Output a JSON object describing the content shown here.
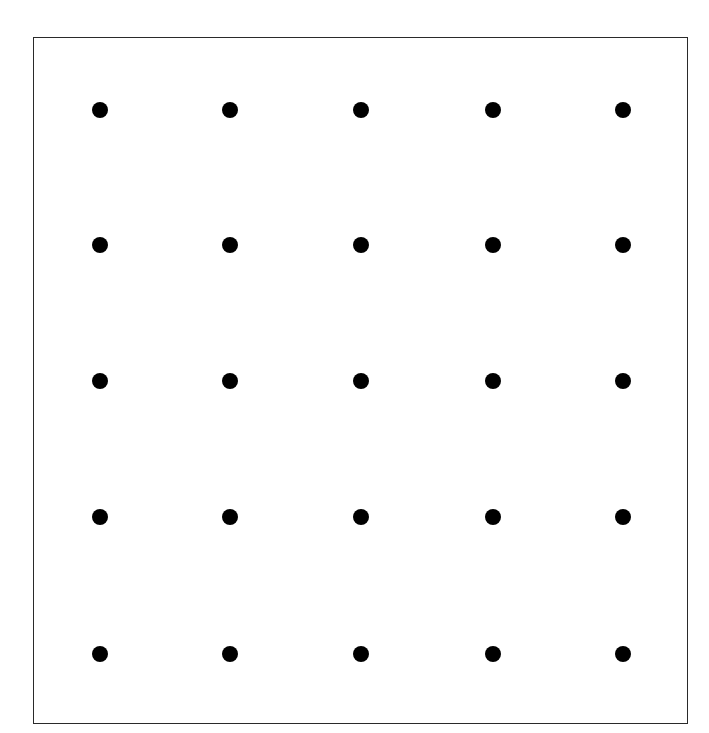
{
  "diagram": {
    "type": "dot-grid",
    "rows": 5,
    "columns": 5,
    "dot_color": "#000000",
    "border_color": "#2a2a2a",
    "background_color": "#ffffff",
    "column_x": [
      100,
      230,
      361,
      493,
      623
    ],
    "row_y": [
      110,
      245,
      381,
      517,
      654
    ]
  }
}
